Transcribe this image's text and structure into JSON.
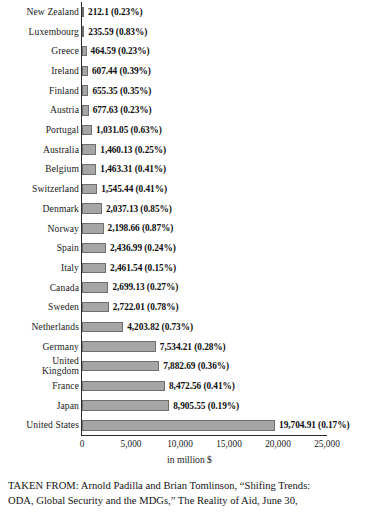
{
  "chart_data": {
    "type": "bar",
    "orientation": "horizontal",
    "title": "",
    "xlabel": "in million $",
    "ylabel": "",
    "xlim": [
      0,
      25000
    ],
    "xticks": [
      "0",
      "5,000",
      "10,000",
      "15,000",
      "20,000",
      "25,000"
    ],
    "xtick_values": [
      0,
      5000,
      10000,
      15000,
      20000,
      25000
    ],
    "grid": false,
    "legend": null,
    "bar_color": "#a6a6a6",
    "bar_edge_color": "#6f6f6f",
    "axis_color": "#2b2b2b",
    "categories": [
      "New Zealand",
      "Luxembourg",
      "Greece",
      "Ireland",
      "Finland",
      "Austria",
      "Portugal",
      "Australia",
      "Belgium",
      "Switzerland",
      "Denmark",
      "Norway",
      "Spain",
      "Italy",
      "Canada",
      "Sweden",
      "Netherlands",
      "Germany",
      "United\nKingdom",
      "France",
      "Japan",
      "United States"
    ],
    "values": [
      212.1,
      235.59,
      464.59,
      607.44,
      655.35,
      677.63,
      1031.05,
      1460.13,
      1463.31,
      1545.44,
      2037.13,
      2198.66,
      2436.99,
      2461.54,
      2699.13,
      2722.01,
      4203.82,
      7534.21,
      7882.69,
      8472.56,
      8905.55,
      19704.91
    ],
    "percent_of_gni": [
      "0.23%",
      "0.83%",
      "0.23%",
      "0.39%",
      "0.35%",
      "0.23%",
      "0.63%",
      "0.25%",
      "0.41%",
      "0.41%",
      "0.85%",
      "0.87%",
      "0.24%",
      "0.15%",
      "0.27%",
      "0.78%",
      "0.73%",
      "0.28%",
      "0.36%",
      "0.41%",
      "0.19%",
      "0.17%"
    ],
    "data_labels": [
      "212.1 (0.23%)",
      "235.59 (0.83%)",
      "464.59 (0.23%)",
      "607.44 (0.39%)",
      "655.35 (0.35%)",
      "677.63 (0.23%)",
      "1,031.05 (0.63%)",
      "1,460.13 (0.25%)",
      "1,463.31 (0.41%)",
      "1,545.44 (0.41%)",
      "2,037.13 (0.85%)",
      "2,198.66 (0.87%)",
      "2,436.99 (0.24%)",
      "2,461.54 (0.15%)",
      "2,699.13 (0.27%)",
      "2,722.01 (0.78%)",
      "4,203.82 (0.73%)",
      "7,534.21 (0.28%)",
      "7,882.69 (0.36%)",
      "8,472.56 (0.41%)",
      "8,905.55 (0.19%)",
      "19,704.91 (0.17%)"
    ]
  },
  "caption": {
    "line1": "TAKEN FROM: Arnold Padilla and Brian Tomlinson, “Shifing Trends:",
    "line2": "ODA, Global Security and the MDGs,” The Reality of Aid, June 30,"
  }
}
